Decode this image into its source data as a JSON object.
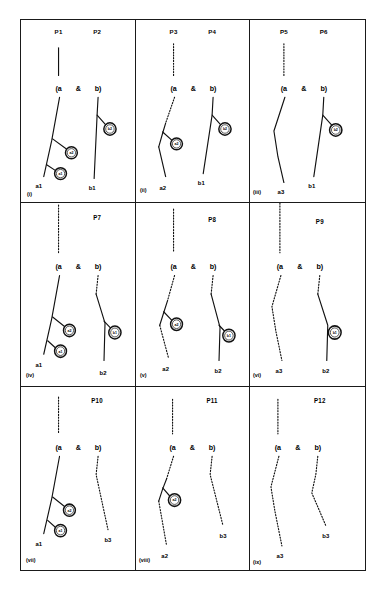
{
  "figure": {
    "type": "diagram-grid",
    "rows": 3,
    "columns": 3,
    "operator_symbol": "&",
    "left_paren_label": "(a",
    "right_paren_label": "b)",
    "ink_color": "#111111",
    "background_color": "#ffffff"
  },
  "panels": [
    {
      "index_label": "(i)",
      "top_labels": [
        "P1",
        "P2"
      ],
      "operator": "&",
      "left_head": "(a",
      "right_head": "b)",
      "left_terminal": "a1",
      "right_terminal": "b1",
      "left_branch_style": "solid",
      "right_branch_style": "solid",
      "left_stem_style": "solid",
      "right_stem_style": "none",
      "markers": [
        "a2",
        "a1",
        "b2"
      ],
      "marker_count": 3
    },
    {
      "index_label": "(ii)",
      "top_labels": [
        "P3",
        "P4"
      ],
      "operator": "&",
      "left_head": "(a",
      "right_head": "b)",
      "left_terminal": "a2",
      "right_terminal": "b1",
      "left_branch_style": "mixed",
      "right_branch_style": "solid",
      "left_stem_style": "dotted",
      "right_stem_style": "none",
      "markers": [
        "a2",
        "b2"
      ],
      "marker_count": 2
    },
    {
      "index_label": "(iii)",
      "top_labels": [
        "P5",
        "P6"
      ],
      "operator": "&",
      "left_head": "(a",
      "right_head": "b)",
      "left_terminal": "a3",
      "right_terminal": "b1",
      "left_branch_style": "solid",
      "right_branch_style": "solid",
      "left_stem_style": "dotted",
      "right_stem_style": "none",
      "markers": [
        "b2"
      ],
      "marker_count": 1
    },
    {
      "index_label": "(iv)",
      "top_labels": [
        "P7"
      ],
      "operator": "&",
      "left_head": "(a",
      "right_head": "b)",
      "left_terminal": "a1",
      "right_terminal": "b2",
      "left_branch_style": "solid",
      "right_branch_style": "solid",
      "left_stem_style": "dotted",
      "right_stem_style": "dotted",
      "markers": [
        "a2",
        "a1",
        "b1"
      ],
      "marker_count": 3
    },
    {
      "index_label": "(v)",
      "top_labels": [
        "P8"
      ],
      "operator": "&",
      "left_head": "(a",
      "right_head": "b)",
      "left_terminal": "a2",
      "right_terminal": "b2",
      "left_branch_style": "mixed",
      "right_branch_style": "solid",
      "left_stem_style": "dotted",
      "right_stem_style": "dotted",
      "markers": [
        "a2",
        "b1"
      ],
      "marker_count": 2
    },
    {
      "index_label": "(vi)",
      "top_labels": [
        "P9"
      ],
      "operator": "&",
      "left_head": "(a",
      "right_head": "b)",
      "left_terminal": "a3",
      "right_terminal": "b2",
      "left_branch_style": "dotted",
      "right_branch_style": "solid",
      "left_stem_style": "dotted",
      "right_stem_style": "dotted",
      "markers": [
        "b1"
      ],
      "marker_count": 1
    },
    {
      "index_label": "(vii)",
      "top_labels": [
        "P10"
      ],
      "operator": "&",
      "left_head": "(a",
      "right_head": "b)",
      "left_terminal": "a1",
      "right_terminal": "b3",
      "left_branch_style": "solid",
      "right_branch_style": "dotted",
      "left_stem_style": "dotted",
      "right_stem_style": "dotted",
      "markers": [
        "a2",
        "a1"
      ],
      "marker_count": 2
    },
    {
      "index_label": "(viii)",
      "top_labels": [
        "P11"
      ],
      "operator": "&",
      "left_head": "(a",
      "right_head": "b)",
      "left_terminal": "a2",
      "right_terminal": "b3",
      "left_branch_style": "mixed",
      "right_branch_style": "dotted",
      "left_stem_style": "dotted",
      "right_stem_style": "dotted",
      "markers": [
        "a2"
      ],
      "marker_count": 1
    },
    {
      "index_label": "(ix)",
      "top_labels": [
        "P12"
      ],
      "operator": "&",
      "left_head": "(a",
      "right_head": "b)",
      "left_terminal": "a3",
      "right_terminal": "b3",
      "left_branch_style": "dotted",
      "right_branch_style": "dotted",
      "left_stem_style": "dotted",
      "right_stem_style": "dotted",
      "markers": [],
      "marker_count": 0
    }
  ]
}
